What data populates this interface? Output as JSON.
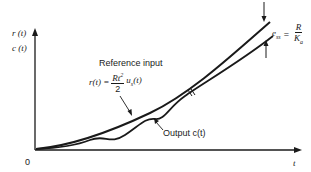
{
  "diagram": {
    "y_axis": {
      "label_top": "r (t)",
      "label_bottom": "c (t)"
    },
    "x_axis": {
      "label": "t",
      "origin": "0"
    },
    "reference": {
      "caption": "Reference input",
      "formula_lhs": "r(t) =",
      "formula_num": "Rt",
      "formula_num_exp": "2",
      "formula_den": "2",
      "formula_rhs": "u",
      "formula_rhs_sub": "s",
      "formula_rhs_arg": "(t)"
    },
    "output": {
      "caption": "Output c(t)"
    },
    "error": {
      "lhs": "e",
      "lhs_sub": "ss",
      "eq": "=",
      "num": "R",
      "den": "K",
      "den_sub": "a"
    },
    "colors": {
      "ink": "#1a1a1a",
      "background": "#ffffff"
    }
  }
}
